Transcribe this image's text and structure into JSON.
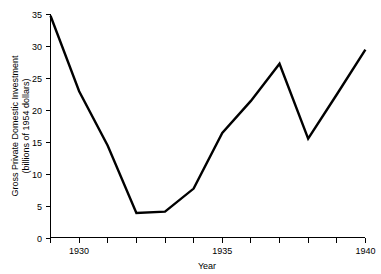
{
  "chart_data": {
    "type": "line",
    "title": "",
    "subtitle": "",
    "xlabel": "Year",
    "ylabel": "Gross Private Domestic Investment (billions of 1954 dollars)",
    "ylabel_line1": "Gross Private Domestic Investment",
    "ylabel_line2": "(billions of 1954 dollars)",
    "x": [
      1929,
      1930,
      1931,
      1932,
      1933,
      1934,
      1935,
      1936,
      1937,
      1938,
      1939,
      1940
    ],
    "values": [
      34.8,
      23.0,
      14.5,
      4.0,
      4.2,
      7.8,
      16.5,
      21.5,
      27.3,
      15.6,
      22.5,
      29.5
    ],
    "series": [
      {
        "name": "Gross Private Domestic Investment",
        "values": [
          34.8,
          23.0,
          14.5,
          4.0,
          4.2,
          7.8,
          16.5,
          21.5,
          27.3,
          15.6,
          22.5,
          29.5
        ],
        "color": "#000000"
      }
    ],
    "xlim": [
      1929,
      1940
    ],
    "ylim": [
      0,
      35
    ],
    "xticks": [
      1929,
      1930,
      1931,
      1932,
      1933,
      1934,
      1935,
      1936,
      1937,
      1938,
      1939,
      1940
    ],
    "xtick_labels": [
      "",
      "1930",
      "",
      "",
      "",
      "",
      "1935",
      "",
      "",
      "",
      "",
      "1940"
    ],
    "yticks": [
      0,
      5,
      10,
      15,
      20,
      25,
      30,
      35
    ],
    "ytick_labels": [
      "0",
      "5",
      "10",
      "15",
      "20",
      "25",
      "30",
      "35"
    ],
    "grid": false,
    "legend": false,
    "legend_position": "none",
    "line_color": "#000000",
    "background_color": "#ffffff"
  },
  "axes": {
    "y_tick_0": "0",
    "y_tick_5": "5",
    "y_tick_10": "10",
    "y_tick_15": "15",
    "y_tick_20": "20",
    "y_tick_25": "25",
    "y_tick_30": "30",
    "y_tick_35": "35",
    "x_tick_1930": "1930",
    "x_tick_1935": "1935",
    "x_tick_1940": "1940",
    "x_axis_title": "Year",
    "y_axis_title_line1": "Gross Private Domestic Investment",
    "y_axis_title_line2": "(billions of 1954 dollars)"
  }
}
